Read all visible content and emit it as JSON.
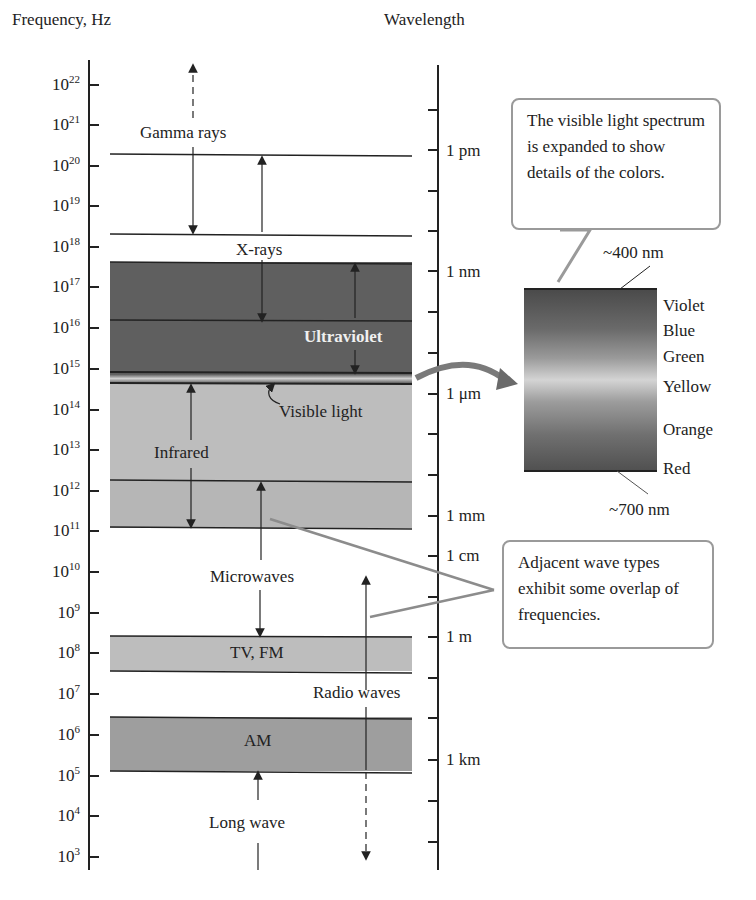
{
  "figure": {
    "left_axis_title": "Frequency, Hz",
    "right_axis_title": "Wavelength"
  },
  "frequency_ticks": [
    {
      "base": "10",
      "exp": "22"
    },
    {
      "base": "10",
      "exp": "21"
    },
    {
      "base": "10",
      "exp": "20"
    },
    {
      "base": "10",
      "exp": "19"
    },
    {
      "base": "10",
      "exp": "18"
    },
    {
      "base": "10",
      "exp": "17"
    },
    {
      "base": "10",
      "exp": "16"
    },
    {
      "base": "10",
      "exp": "15"
    },
    {
      "base": "10",
      "exp": "14"
    },
    {
      "base": "10",
      "exp": "13"
    },
    {
      "base": "10",
      "exp": "12"
    },
    {
      "base": "10",
      "exp": "11"
    },
    {
      "base": "10",
      "exp": "10"
    },
    {
      "base": "10",
      "exp": "9"
    },
    {
      "base": "10",
      "exp": "8"
    },
    {
      "base": "10",
      "exp": "7"
    },
    {
      "base": "10",
      "exp": "6"
    },
    {
      "base": "10",
      "exp": "5"
    },
    {
      "base": "10",
      "exp": "4"
    },
    {
      "base": "10",
      "exp": "3"
    }
  ],
  "wavelength_labels": {
    "pm": "1 pm",
    "nm": "1 nm",
    "um": "1 μm",
    "mm": "1 mm",
    "cm": "1 cm",
    "m": "1 m",
    "km": "1 km"
  },
  "bands": {
    "gamma": "Gamma rays",
    "xrays": "X-rays",
    "ultraviolet": "Ultraviolet",
    "visible": "Visible light",
    "infrared": "Infrared",
    "microwaves": "Microwaves",
    "tvfm": "TV, FM",
    "radio": "Radio waves",
    "am": "AM",
    "longwave": "Long wave"
  },
  "spectrum": {
    "top_label": "~400 nm",
    "bottom_label": "~700 nm",
    "colors": [
      "Violet",
      "Blue",
      "Green",
      "Yellow",
      "Orange",
      "Red"
    ]
  },
  "callouts": {
    "visible": "The visible light spectrum is expanded to show details of the colors.",
    "overlap": "Adjacent wave types exhibit some overlap of frequencies."
  },
  "colors": {
    "uv_band": "#5f5f5f",
    "ir_band": "#bdbdbd",
    "tvfm_band": "#bdbdbd",
    "am_band": "#9e9e9e",
    "callout_border": "#9a9a9a",
    "leader_line": "#8c8c8c"
  }
}
